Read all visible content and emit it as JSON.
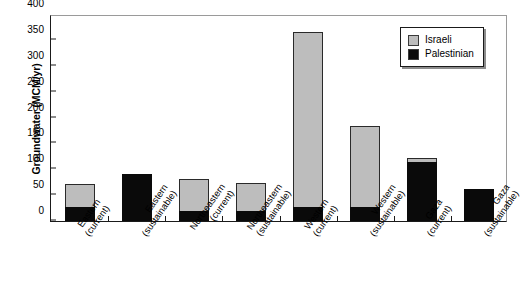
{
  "chart_data": {
    "type": "bar",
    "title": "",
    "xlabel": "",
    "ylabel": "Groundwater (MCM/yr)",
    "ylim": [
      0,
      400
    ],
    "yticks": [
      0,
      50,
      100,
      150,
      200,
      250,
      300,
      350,
      400
    ],
    "grid": false,
    "stacked": true,
    "legend_position": "top-right",
    "categories": [
      "Eastern (current)",
      "Eastern (sustainable)",
      "Northeastern (current)",
      "Northeastern (sustainable)",
      "Western (current)",
      "Western (sustainable)",
      "Gaza (current)",
      "Gaza (sustainable)"
    ],
    "category_lines": [
      [
        "Eastern",
        "(current)"
      ],
      [
        "Eastern",
        "(sustainable)"
      ],
      [
        "Northeastern",
        "(current)"
      ],
      [
        "Northeastern",
        "(sustainable)"
      ],
      [
        "Western",
        "(current)"
      ],
      [
        "Western",
        "(sustainable)"
      ],
      [
        "Gaza",
        "(current)"
      ],
      [
        "Gaza",
        "(sustainable)"
      ]
    ],
    "series": [
      {
        "name": "Palestinian",
        "color": "#0a0a0a",
        "values": [
          25,
          88,
          17,
          18,
          25,
          25,
          113,
          60
        ]
      },
      {
        "name": "Israeli",
        "color": "#bdbdbd",
        "values": [
          46,
          0,
          64,
          55,
          340,
          158,
          9,
          0
        ]
      }
    ],
    "totals": [
      71,
      88,
      81,
      73,
      365,
      183,
      122,
      60
    ]
  },
  "legend": {
    "entries": [
      {
        "label": "Israeli",
        "color": "#bdbdbd"
      },
      {
        "label": "Palestinian",
        "color": "#0a0a0a"
      }
    ]
  },
  "artifact": {
    "text": ""
  }
}
